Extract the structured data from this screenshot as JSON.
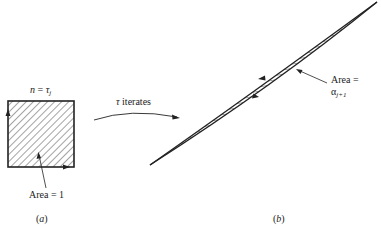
{
  "panel_a": {
    "top_label_var": "n",
    "top_label_eq": " = ",
    "top_label_sym": "τ",
    "top_label_sub": "j",
    "area_label": "Area = 1",
    "caption_open": "(",
    "caption_letter": "a",
    "caption_close": ")"
  },
  "transition": {
    "label_sym": "τ",
    "label_text": " iterates"
  },
  "panel_b": {
    "area_label_line1": "Area =",
    "area_label_sym": "α",
    "area_label_sub": "j+1",
    "caption_open": "(",
    "caption_letter": "b",
    "caption_close": ")"
  },
  "colors": {
    "ink": "#222222",
    "background": "#ffffff"
  }
}
